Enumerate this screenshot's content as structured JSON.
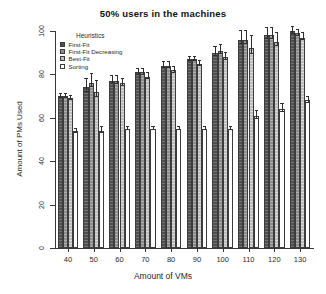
{
  "chart_data": {
    "type": "bar",
    "title": "50% users in the machines",
    "xlabel": "Amount of VMs",
    "ylabel": "Amount of PMs Used",
    "categories": [
      "40",
      "50",
      "60",
      "70",
      "80",
      "90",
      "100",
      "110",
      "120",
      "130"
    ],
    "ylim": [
      0,
      100
    ],
    "yticks": [
      0,
      20,
      40,
      60,
      80,
      100
    ],
    "grid": false,
    "legend_title": "Heuristics",
    "legend_position": "top-left inside plot",
    "series": [
      {
        "name": "First-Fit",
        "color": "#4f4f4f",
        "values": [
          70,
          74,
          77,
          81,
          84,
          87,
          90,
          96,
          98,
          100
        ],
        "errors": [
          1.5,
          4.5,
          2.5,
          2.0,
          2.0,
          1.5,
          3.0,
          4.5,
          4.0,
          2.5
        ]
      },
      {
        "name": "First-Fit Decreasing",
        "color": "#8d8d8d",
        "values": [
          70,
          76,
          77,
          81,
          84,
          87,
          91,
          96,
          98,
          99
        ],
        "errors": [
          1.5,
          4.5,
          2.5,
          2.0,
          2.0,
          1.5,
          3.0,
          4.5,
          4.0,
          2.0
        ]
      },
      {
        "name": "Best-Fit",
        "color": "#bdbdbd",
        "values": [
          69,
          72,
          76,
          79,
          82,
          85,
          88,
          92,
          95,
          97
        ],
        "errors": [
          1.5,
          5.5,
          2.5,
          2.0,
          2.0,
          1.5,
          2.5,
          6.0,
          4.5,
          2.5
        ]
      },
      {
        "name": "Sorting",
        "color": "#ffffff",
        "values": [
          54,
          54,
          55,
          55,
          55,
          55,
          55,
          61,
          64,
          68
        ],
        "errors": [
          1.5,
          2.0,
          1.0,
          1.0,
          1.0,
          1.0,
          1.0,
          2.5,
          3.0,
          2.0
        ]
      }
    ]
  }
}
